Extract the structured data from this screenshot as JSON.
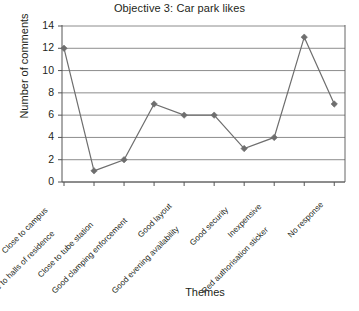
{
  "chart_data": {
    "type": "line",
    "title": "Objective 3: Car park likes",
    "xlabel": "Themes",
    "ylabel": "Number of comments",
    "categories": [
      "Close to campus",
      "Close to halls of residence",
      "Close to tube station",
      "Good clamping enforcement",
      "Good layout",
      "Good evening availability",
      "Good security",
      "Inexpensive",
      "Red authorisation sticker",
      "No response"
    ],
    "values": [
      12,
      1,
      2,
      7,
      6,
      6,
      3,
      4,
      13,
      7
    ],
    "ylim": [
      0,
      14
    ],
    "yticks": [
      0,
      2,
      4,
      6,
      8,
      10,
      12,
      14
    ],
    "ytick_labels": [
      "0",
      "2",
      "4",
      "6",
      "8",
      "10",
      "12",
      "14"
    ],
    "grid": "horizontal",
    "legend": "none",
    "series_color": "#6e6e6e",
    "marker": "diamond",
    "gridline_color": "#808080",
    "axis_color": "#555555",
    "background": "#ffffff"
  }
}
